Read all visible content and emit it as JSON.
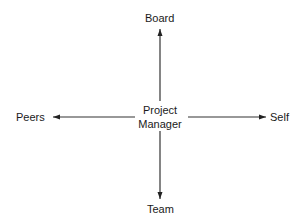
{
  "diagram": {
    "type": "relationship-cross",
    "center": {
      "line1": "Project",
      "line2": "Manager"
    },
    "nodes": {
      "top": "Board",
      "left": "Peers",
      "right": "Self",
      "bottom": "Team"
    },
    "edges": [
      {
        "from": "Project Manager",
        "to": "Board",
        "direction": "up"
      },
      {
        "from": "Project Manager",
        "to": "Peers",
        "direction": "left"
      },
      {
        "from": "Project Manager",
        "to": "Self",
        "direction": "right"
      },
      {
        "from": "Project Manager",
        "to": "Team",
        "direction": "down"
      }
    ],
    "colors": {
      "line": "#333333",
      "text": "#1a1a1a",
      "background": "#ffffff"
    }
  }
}
